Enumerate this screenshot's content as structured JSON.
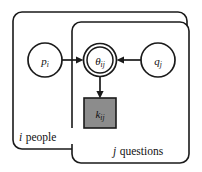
{
  "diagram": {
    "type": "plate-notation-bayesian-network",
    "background_color": "#ffffff",
    "line_color": "#1a1a1a",
    "plates": [
      {
        "id": "people-plate",
        "label_index": "i",
        "label_text": "people",
        "label_full": "i people",
        "x": 13,
        "y": 12,
        "width": 174,
        "height": 137,
        "corner_radius": 9
      },
      {
        "id": "questions-plate",
        "label_index": "j",
        "label_text": "questions",
        "label_full": "j questions",
        "x": 72,
        "y": 22,
        "width": 117,
        "height": 141,
        "corner_radius": 9
      }
    ],
    "nodes": [
      {
        "id": "p-node",
        "symbol": "p",
        "subscript": "i",
        "label_full": "p_i",
        "shape": "circle",
        "style": "single-circle",
        "observed": false,
        "cx": 45,
        "cy": 60,
        "r": 17,
        "fill": "#ffffff"
      },
      {
        "id": "theta-node",
        "symbol": "θ",
        "subscript": "ij",
        "label_full": "θ_ij",
        "shape": "circle",
        "style": "double-circle",
        "observed": false,
        "cx": 100,
        "cy": 60,
        "r": 16.5,
        "r_inner": 13,
        "fill": "#ffffff"
      },
      {
        "id": "q-node",
        "symbol": "q",
        "subscript": "j",
        "label_full": "q_j",
        "shape": "circle",
        "style": "single-circle",
        "observed": false,
        "cx": 158,
        "cy": 60,
        "r": 17,
        "fill": "#ffffff"
      },
      {
        "id": "k-node",
        "symbol": "k",
        "subscript": "ij",
        "label_full": "k_ij",
        "shape": "square",
        "style": "shaded-square",
        "observed": true,
        "x": 84,
        "y": 98,
        "width": 32,
        "height": 30,
        "fill": "#8c8c8c"
      }
    ],
    "edges": [
      {
        "id": "p-to-theta",
        "from": "p-node",
        "to": "theta-node",
        "direction": "right",
        "arrowhead": true
      },
      {
        "id": "q-to-theta",
        "from": "q-node",
        "to": "theta-node",
        "direction": "left",
        "arrowhead": true
      },
      {
        "id": "theta-to-k",
        "from": "theta-node",
        "to": "k-node",
        "direction": "down",
        "arrowhead": true
      }
    ]
  }
}
